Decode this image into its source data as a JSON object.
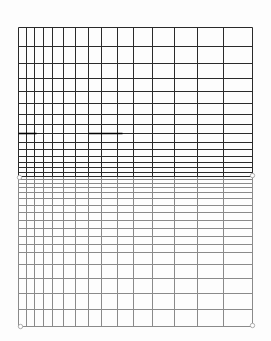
{
  "diagram": {
    "kind": "distorted-grid",
    "canvas": {
      "width": 271,
      "height": 341
    },
    "border": {
      "left": 18,
      "right": 252,
      "top": 27,
      "bottom": 326
    },
    "colors": {
      "background": "#fdfdfd",
      "upper_lines": "#2a2a2a",
      "lower_lines": "#8a8a8a",
      "accent_segments": "#000000",
      "markers": "#9a9a9a"
    },
    "vertical_lines_x": [
      18,
      26,
      34,
      43,
      52,
      63,
      75,
      88,
      101,
      117,
      133,
      152,
      174,
      197,
      223,
      252
    ],
    "upper_horizontal_lines_y": [
      27,
      46,
      63,
      78,
      91,
      103,
      114,
      124,
      133,
      142,
      149,
      156,
      162,
      167,
      172,
      176
    ],
    "lower_horizontal_lines_y": [
      179,
      183,
      187,
      192,
      198,
      205,
      212,
      220,
      228,
      236,
      244,
      252,
      264,
      278,
      293,
      309,
      326
    ],
    "accent_segments": [
      {
        "y": 133,
        "x1": 18,
        "x2": 36
      },
      {
        "y": 133,
        "x1": 88,
        "x2": 122
      }
    ],
    "markers": [
      {
        "name": "left-mid-marker",
        "x": 19,
        "y": 177
      },
      {
        "name": "right-mid-marker",
        "x": 252,
        "y": 175
      },
      {
        "name": "bottom-left-marker",
        "x": 20,
        "y": 326
      },
      {
        "name": "bottom-right-marker",
        "x": 252,
        "y": 325
      }
    ]
  }
}
